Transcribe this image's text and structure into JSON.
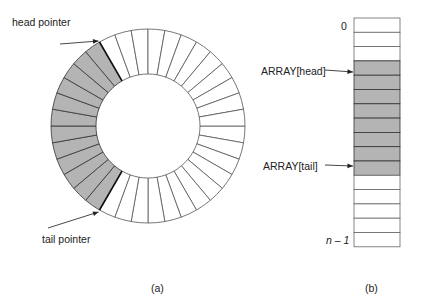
{
  "figure_a": {
    "head_label": "head pointer",
    "tail_label": "tail pointer",
    "caption": "(a)",
    "segments": 36,
    "shaded_color": "#b4b4b4"
  },
  "figure_b": {
    "index_top": "0",
    "index_bottom": "n – 1",
    "head_label": "ARRAY[head]",
    "tail_label": "ARRAY[tail]",
    "caption": "(b)",
    "rows": 16,
    "shaded_rows": [
      3,
      4,
      5,
      6,
      7,
      8,
      9,
      10
    ],
    "shaded_color": "#b4b4b4"
  }
}
